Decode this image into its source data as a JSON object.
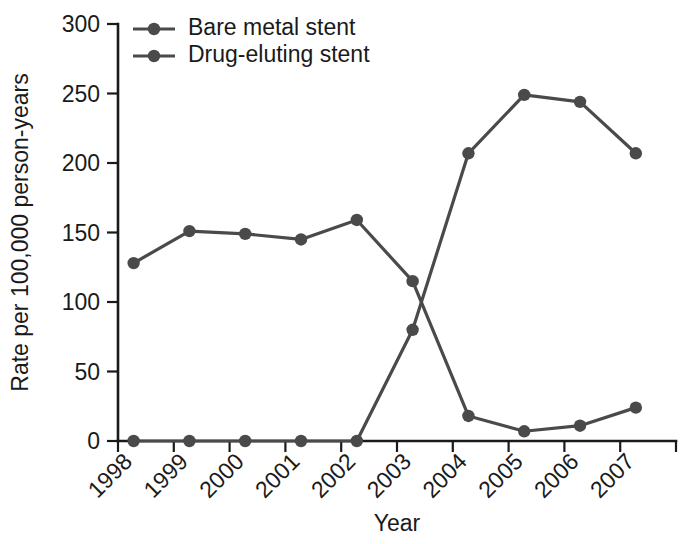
{
  "chart_data": {
    "type": "line",
    "title": "",
    "xlabel": "Year",
    "ylabel": "Rate per 100,000 person-years",
    "categories": [
      "1998",
      "1999",
      "2000",
      "2001",
      "2002",
      "2003",
      "2004",
      "2005",
      "2006",
      "2007"
    ],
    "xlim": [
      "1998",
      "2007"
    ],
    "ylim": [
      0,
      300
    ],
    "yticks": [
      0,
      50,
      100,
      150,
      200,
      250,
      300
    ],
    "ytick_labels": [
      "0",
      "50",
      "100",
      "150",
      "200",
      "250",
      "300"
    ],
    "grid": false,
    "legend_position": "top-left",
    "xtick_rotation": -45,
    "series": [
      {
        "name": "Bare metal stent",
        "color": "#4a4a4a",
        "values": [
          128,
          151,
          149,
          145,
          159,
          115,
          18,
          7,
          11,
          24
        ]
      },
      {
        "name": "Drug-eluting stent",
        "color": "#4a4a4a",
        "values": [
          0,
          0,
          0,
          0,
          0,
          80,
          207,
          249,
          244,
          207
        ]
      }
    ]
  },
  "legend": {
    "items": [
      {
        "label": "Bare metal stent",
        "color": "#4a4a4a"
      },
      {
        "label": "Drug-eluting stent",
        "color": "#4a4a4a"
      }
    ]
  },
  "colors": {
    "axis": "#1a1a1a",
    "series": "#4a4a4a",
    "background": "#ffffff"
  }
}
